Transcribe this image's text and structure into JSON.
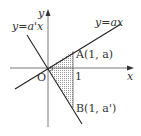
{
  "diagram": {
    "axes": {
      "x_label": "x",
      "y_label": "y",
      "origin_label": "O"
    },
    "lines": [
      {
        "name": "line-ax",
        "label": "y=ax"
      },
      {
        "name": "line-a-prime-x",
        "label": "y=a'x"
      }
    ],
    "points": [
      {
        "name": "A",
        "label": "A(1, a)"
      },
      {
        "name": "B",
        "label": "B(1, a')"
      }
    ],
    "tick_label": "1",
    "shaded_region": "triangle OAB",
    "colors": {
      "line": "#222222",
      "axis": "#333333",
      "shade": "#bdbdbd"
    }
  }
}
